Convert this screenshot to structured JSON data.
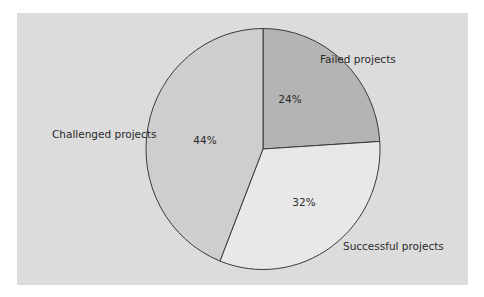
{
  "chart_data": {
    "type": "pie",
    "title": "",
    "categories": [
      "Failed projects",
      "Successful projects",
      "Challenged projects"
    ],
    "values": [
      24,
      32,
      44
    ],
    "unit": "%",
    "value_labels": [
      "24%",
      "32%",
      "44%"
    ],
    "colors": [
      "#b4b4b4",
      "#e8e8e8",
      "#cecece"
    ],
    "start_angle_deg": 0,
    "direction": "clockwise",
    "legend": "none (direct labels outside slices)",
    "background": "#dcdcdc"
  },
  "labels": {
    "failed": "Failed projects",
    "successful": "Successful projects",
    "challenged": "Challenged projects",
    "failed_pct": "24%",
    "successful_pct": "32%",
    "challenged_pct": "44%"
  }
}
